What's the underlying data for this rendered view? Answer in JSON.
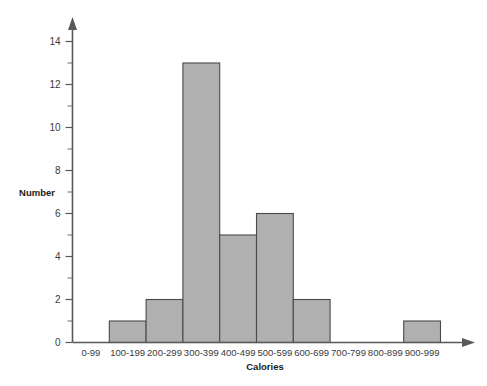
{
  "chart_data": {
    "type": "bar",
    "title": "",
    "xlabel": "Calories",
    "ylabel": "Number",
    "categories": [
      "0-99",
      "100-199",
      "200-299",
      "300-399",
      "400-499",
      "500-599",
      "600-699",
      "700-799",
      "800-899",
      "900-999"
    ],
    "values": [
      0,
      1,
      2,
      13,
      5,
      6,
      2,
      0,
      0,
      1
    ],
    "ylim": [
      0,
      15
    ],
    "y_major_ticks": [
      0,
      2,
      4,
      6,
      8,
      10,
      12,
      14
    ],
    "y_minor_ticks": [
      1,
      3,
      5,
      7,
      9,
      11,
      13
    ],
    "y_tick_labels": [
      "0",
      "2",
      "4",
      "6",
      "8",
      "10",
      "12",
      "14"
    ],
    "grid": false,
    "legend": "none",
    "bar_fill_color": "#b0b0b0",
    "bar_edge_color": "#4a4a4a",
    "axis_color": "#595959"
  },
  "axis": {
    "y_ticks": [
      {
        "value": 14,
        "label": "14"
      },
      {
        "value": 12,
        "label": "12"
      },
      {
        "value": 10,
        "label": "10"
      },
      {
        "value": 8,
        "label": "8"
      },
      {
        "value": 6,
        "label": "6"
      },
      {
        "value": 4,
        "label": "4"
      },
      {
        "value": 2,
        "label": "2"
      },
      {
        "value": 0,
        "label": "0"
      }
    ]
  }
}
